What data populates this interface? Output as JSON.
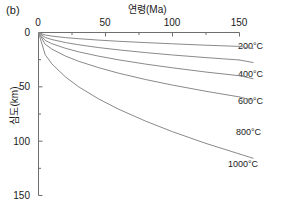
{
  "panel": {
    "label": "(b)"
  },
  "colors": {
    "axis": "#6e6e6e",
    "curve": "#8a8a8a",
    "text": "#1a1a1a",
    "background": "#ffffff"
  },
  "chart_data": {
    "type": "line",
    "title": "",
    "subtitle": "",
    "xlabel": "연령(Ma)",
    "ylabel": "심도(km)",
    "xlabel_position": "top",
    "ylabel_position": "left",
    "xlim": [
      0,
      150
    ],
    "ylim": [
      0,
      150
    ],
    "y_inverted": true,
    "grid": false,
    "legend": "inline-right-of-curve-ends",
    "xticks": [
      0,
      50,
      100,
      150
    ],
    "xticklabels": [
      "0",
      "50",
      "100",
      "150"
    ],
    "xminorticks": [
      25,
      75,
      125
    ],
    "yticks": [
      0,
      50,
      100,
      150
    ],
    "yticklabels": [
      "0",
      "50",
      "100",
      "150"
    ],
    "yminorticks": [
      25,
      75,
      125
    ],
    "x": [
      0,
      5,
      10,
      20,
      30,
      45,
      60,
      80,
      100,
      125,
      150
    ],
    "series": [
      {
        "name": "200°C",
        "label": "200°C",
        "values": [
          0,
          2.3,
          3.3,
          4.7,
          5.7,
          7.0,
          8.1,
          9.3,
          10.4,
          11.7,
          12.8
        ]
      },
      {
        "name": "400°C",
        "label": "400°C",
        "values": [
          0,
          4.6,
          6.5,
          9.2,
          11.3,
          13.9,
          16.0,
          18.5,
          20.7,
          23.1,
          25.3
        ]
      },
      {
        "name": "600°C",
        "label": "600°C",
        "values": [
          0,
          7.3,
          10.3,
          14.5,
          17.8,
          21.8,
          25.2,
          29.1,
          32.5,
          36.4,
          39.8
        ]
      },
      {
        "name": "800°C",
        "label": "800°C",
        "values": [
          0,
          10.8,
          15.3,
          21.6,
          26.5,
          32.4,
          37.5,
          43.3,
          48.4,
          54.1,
          59.3
        ]
      },
      {
        "name": "1000°C",
        "label": "1000°C",
        "values": [
          0,
          20.4,
          28.9,
          40.8,
          50.0,
          61.2,
          70.7,
          81.6,
          91.3,
          102.1,
          111.8
        ]
      }
    ]
  }
}
